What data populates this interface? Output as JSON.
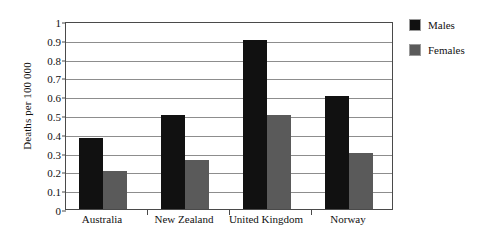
{
  "chart_data": {
    "type": "bar",
    "title": "",
    "xlabel": "",
    "ylabel": "Deaths per 100 000",
    "ylim": [
      0,
      1
    ],
    "ytick_step": 0.1,
    "yticks": [
      "1",
      "0.9",
      "0.8",
      "0.7",
      "0.6",
      "0.5",
      "0.4",
      "0.3",
      "0.2",
      "0.1",
      "0"
    ],
    "ytick_values": [
      1,
      0.9,
      0.8,
      0.7,
      0.6,
      0.5,
      0.4,
      0.3,
      0.2,
      0.1,
      0
    ],
    "grid": true,
    "grid_orientation": "horizontal",
    "legend_position": "right-outside",
    "categories": [
      "Australia",
      "New Zealand",
      "United Kingdom",
      "Norway"
    ],
    "series": [
      {
        "name": "Males",
        "color": "#111111",
        "values": [
          0.38,
          0.5,
          0.9,
          0.6
        ]
      },
      {
        "name": "Females",
        "color": "#5a5a5a",
        "values": [
          0.2,
          0.26,
          0.5,
          0.3
        ]
      }
    ]
  }
}
